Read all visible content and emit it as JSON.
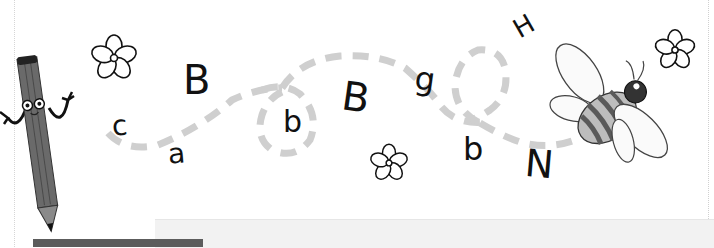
{
  "worksheet": {
    "theme": "letter trail from pencil to bee",
    "colors": {
      "background": "#ffffff",
      "ink": "#111111",
      "trail": "#cfcfcf",
      "pencil_body": "#6a6a6a",
      "pencil_tip": "#8a8a8a",
      "bee_stripe": "#5a5a5a",
      "bee_body": "#bdbdbd",
      "bottom_bar": "#5c5c5c",
      "bottom_panel": "#f2f2f2"
    },
    "letters": [
      {
        "char": "c",
        "x": 112,
        "y": 112,
        "size": 28,
        "rotate": -5
      },
      {
        "char": "a",
        "x": 168,
        "y": 140,
        "size": 28,
        "rotate": -5
      },
      {
        "char": "B",
        "x": 183,
        "y": 60,
        "size": 40,
        "rotate": 0
      },
      {
        "char": "b",
        "x": 283,
        "y": 107,
        "size": 30,
        "rotate": 0
      },
      {
        "char": "B",
        "x": 342,
        "y": 77,
        "size": 40,
        "rotate": 8
      },
      {
        "char": "g",
        "x": 415,
        "y": 63,
        "size": 32,
        "rotate": 8
      },
      {
        "char": "b",
        "x": 463,
        "y": 133,
        "size": 32,
        "rotate": 0
      },
      {
        "char": "H",
        "x": 514,
        "y": 13,
        "size": 26,
        "rotate": -30
      },
      {
        "char": "N",
        "x": 525,
        "y": 145,
        "size": 38,
        "rotate": 5
      }
    ],
    "flowers": [
      {
        "name": "flower-top-left",
        "cx": 114,
        "cy": 58,
        "r": 24
      },
      {
        "name": "flower-middle",
        "cx": 389,
        "cy": 163,
        "r": 20
      },
      {
        "name": "flower-top-right",
        "cx": 675,
        "cy": 50,
        "r": 21
      }
    ],
    "characters": {
      "pencil": "pencil-character",
      "bee": "bee-character"
    }
  }
}
